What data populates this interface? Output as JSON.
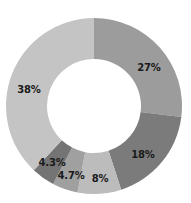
{
  "chart_data": {
    "type": "pie",
    "variant": "donut",
    "title": "",
    "categories": [
      "Segment A",
      "Segment B",
      "Segment C",
      "Segment D",
      "Segment E",
      "Segment F"
    ],
    "values": [
      27,
      18,
      8,
      4.7,
      4.3,
      38
    ],
    "labels": [
      "27%",
      "18%",
      "8%",
      "4.7%",
      "4.3%",
      "38%"
    ],
    "colors": [
      "#9c9c9c",
      "#7b7b7b",
      "#bcbcbc",
      "#a0a0a0",
      "#747474",
      "#c4c4c4"
    ],
    "start_angle_deg": 0,
    "direction": "clockwise",
    "legend": "none",
    "center": [
      94,
      106
    ],
    "outer_radius": 88,
    "inner_radius": 47
  },
  "slices": [
    {
      "label": "27%",
      "value": 27,
      "color": "#9c9c9c",
      "lx": 149,
      "ly": 67
    },
    {
      "label": "18%",
      "value": 18,
      "color": "#7b7b7b",
      "lx": 143,
      "ly": 154
    },
    {
      "label": "8%",
      "value": 8,
      "color": "#bcbcbc",
      "lx": 100,
      "ly": 178
    },
    {
      "label": "4.7%",
      "value": 4.7,
      "color": "#a0a0a0",
      "lx": 71,
      "ly": 175
    },
    {
      "label": "4.3%",
      "value": 4.3,
      "color": "#747474",
      "lx": 52,
      "ly": 162
    },
    {
      "label": "38%",
      "value": 38,
      "color": "#c4c4c4",
      "lx": 29,
      "ly": 89
    }
  ]
}
